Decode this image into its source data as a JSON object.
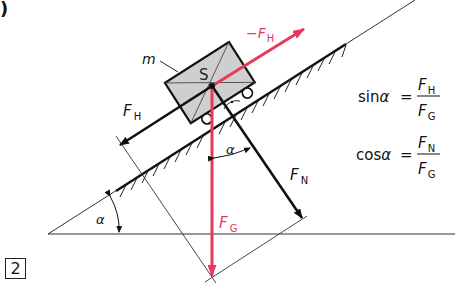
{
  "figure": {
    "corner_mark": ")",
    "number": "2",
    "colors": {
      "ink": "#111111",
      "accent_red": "#e8395a",
      "block_fill": "#cfcfcf"
    },
    "labels": {
      "mass": "m",
      "center": "S",
      "neg_fh_prefix": "−",
      "neg_fh_f": "F",
      "neg_fh_sub": "H",
      "fh_f": "F",
      "fh_sub": "H",
      "fn_f": "F",
      "fn_sub": "N",
      "fg_f": "F",
      "fg_sub": "G",
      "alpha_incline": "α",
      "alpha_forces": "α"
    },
    "formulas": [
      {
        "lhs": "sin",
        "angle": "α",
        "eq": "=",
        "num_f": "F",
        "num_sub": "H",
        "den_f": "F",
        "den_sub": "G"
      },
      {
        "lhs": "cos",
        "angle": "α",
        "eq": "=",
        "num_f": "F",
        "num_sub": "N",
        "den_f": "F",
        "den_sub": "G"
      }
    ]
  }
}
